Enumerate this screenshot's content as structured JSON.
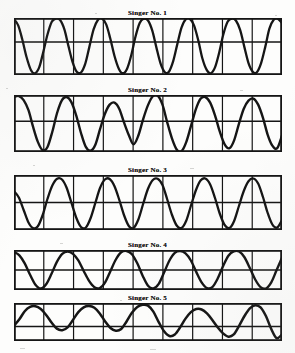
{
  "figure": {
    "kind": "oscillogram-series",
    "panel_count": 5,
    "ink_color": "#151515",
    "paper_color": "#fdfdfc"
  },
  "panels": [
    {
      "title": "Singer No. 1",
      "index": 1,
      "frame": {
        "x": 14,
        "y": 20,
        "width": 268,
        "height": 57
      },
      "v_divisions": 9,
      "axis_fraction": 0.42,
      "trace_width": 2.3
    },
    {
      "title": "Singer No. 2",
      "index": 2,
      "frame": {
        "x": 14,
        "y": 97,
        "width": 268,
        "height": 57
      },
      "v_divisions": 9,
      "axis_fraction": 0.46,
      "trace_width": 2.4
    },
    {
      "title": "Singer No. 3",
      "index": 3,
      "frame": {
        "x": 14,
        "y": 177,
        "width": 268,
        "height": 55
      },
      "v_divisions": 9,
      "axis_fraction": 0.5,
      "trace_width": 2.3
    },
    {
      "title": "Singer No. 4",
      "index": 4,
      "frame": {
        "x": 14,
        "y": 252,
        "width": 268,
        "height": 40
      },
      "v_divisions": 9,
      "axis_fraction": 0.5,
      "trace_width": 2.4
    },
    {
      "title": "Singer No. 5",
      "index": 5,
      "frame": {
        "x": 14,
        "y": 305,
        "width": 268,
        "height": 38
      },
      "v_divisions": 9,
      "axis_fraction": 0.62,
      "trace_width": 2.5
    }
  ],
  "chart_data": [
    {
      "type": "line",
      "title": "Singer No. 1",
      "xlabel": "",
      "ylabel": "",
      "grid": true,
      "legend": "none",
      "xlim": [
        0,
        1
      ],
      "ylim": [
        -1.25,
        1.0
      ],
      "description": "Near-sinusoidal vibrato waveform, about 8 cycles across the record, peaks clipped flat at the top frame line, troughs dipping below the lower frame line.",
      "cycles": 8,
      "series": [
        {
          "name": "trace",
          "x": [
            0.0,
            0.016,
            0.031,
            0.047,
            0.063,
            0.078,
            0.094,
            0.109,
            0.125,
            0.141,
            0.156,
            0.172,
            0.188,
            0.203,
            0.219,
            0.234,
            0.25,
            0.266,
            0.281,
            0.297,
            0.313,
            0.328,
            0.344,
            0.359,
            0.375,
            0.391,
            0.406,
            0.422,
            0.438,
            0.453,
            0.469,
            0.484,
            0.5,
            0.516,
            0.531,
            0.547,
            0.563,
            0.578,
            0.594,
            0.609,
            0.625,
            0.641,
            0.656,
            0.672,
            0.688,
            0.703,
            0.719,
            0.734,
            0.75,
            0.766,
            0.781,
            0.797,
            0.813,
            0.828,
            0.844,
            0.859,
            0.875,
            0.891,
            0.906,
            0.922,
            0.938,
            0.953,
            0.969,
            0.984,
            1.0
          ],
          "y": [
            0.95,
            0.7,
            0.15,
            -0.55,
            -1.05,
            -1.18,
            -0.95,
            -0.35,
            0.35,
            0.85,
            0.98,
            0.92,
            0.55,
            -0.1,
            -0.75,
            -1.12,
            -1.15,
            -0.8,
            -0.15,
            0.55,
            0.92,
            0.98,
            0.75,
            0.2,
            -0.5,
            -1.0,
            -1.18,
            -1.0,
            -0.45,
            0.25,
            0.8,
            0.97,
            0.9,
            0.5,
            -0.15,
            -0.8,
            -1.14,
            -1.12,
            -0.7,
            -0.05,
            0.62,
            0.95,
            0.97,
            0.7,
            0.1,
            -0.6,
            -1.05,
            -1.18,
            -0.95,
            -0.35,
            0.35,
            0.85,
            0.98,
            0.9,
            0.52,
            -0.12,
            -0.78,
            -1.12,
            -1.14,
            -0.78,
            -0.12,
            0.58,
            0.93,
            0.97,
            0.8
          ]
        }
      ]
    },
    {
      "type": "line",
      "title": "Singer No. 2",
      "xlabel": "",
      "ylabel": "",
      "grid": true,
      "legend": "none",
      "xlim": [
        0,
        1
      ],
      "ylim": [
        -1.25,
        1.0
      ],
      "description": "Slower, irregular vibrato with uneven amplitudes; about 6 broad cycles, some peaks reaching the upper frame and deep troughs breaking the lower frame line.",
      "cycles": 6,
      "series": [
        {
          "name": "trace",
          "x": [
            0.0,
            0.018,
            0.036,
            0.054,
            0.071,
            0.089,
            0.107,
            0.125,
            0.143,
            0.161,
            0.179,
            0.196,
            0.214,
            0.232,
            0.25,
            0.268,
            0.286,
            0.304,
            0.321,
            0.339,
            0.357,
            0.375,
            0.393,
            0.411,
            0.429,
            0.446,
            0.464,
            0.482,
            0.5,
            0.518,
            0.536,
            0.554,
            0.571,
            0.589,
            0.607,
            0.625,
            0.643,
            0.661,
            0.679,
            0.696,
            0.714,
            0.732,
            0.75,
            0.768,
            0.786,
            0.804,
            0.821,
            0.839,
            0.857,
            0.875,
            0.893,
            0.911,
            0.929,
            0.946,
            0.964,
            0.982,
            1.0
          ],
          "y": [
            0.92,
            0.96,
            0.8,
            0.4,
            -0.25,
            -0.85,
            -1.18,
            -1.05,
            -0.45,
            0.3,
            0.8,
            0.92,
            0.72,
            0.2,
            -0.5,
            -1.05,
            -1.2,
            -0.95,
            -0.35,
            0.25,
            0.62,
            0.7,
            0.45,
            -0.1,
            -0.6,
            -0.95,
            -0.6,
            0.05,
            0.6,
            0.95,
            0.98,
            0.62,
            -0.05,
            -0.7,
            -1.15,
            -1.22,
            -0.85,
            -0.2,
            0.45,
            0.85,
            0.92,
            0.7,
            0.2,
            -0.45,
            -0.95,
            -1.1,
            -0.8,
            -0.15,
            0.45,
            0.78,
            0.86,
            0.62,
            0.1,
            -0.55,
            -1.0,
            -1.1,
            -0.6
          ]
        }
      ]
    },
    {
      "type": "line",
      "title": "Singer No. 3",
      "xlabel": "",
      "ylabel": "",
      "grid": true,
      "legend": "none",
      "xlim": [
        0,
        1
      ],
      "ylim": [
        -1.2,
        1.0
      ],
      "description": "Regular rounded vibrato of moderate rate, roughly 7 cycles, crests flattened near the top of the frame and troughs touching the baseline frame.",
      "cycles": 7,
      "series": [
        {
          "name": "trace",
          "x": [
            0.0,
            0.018,
            0.036,
            0.054,
            0.071,
            0.089,
            0.107,
            0.125,
            0.143,
            0.161,
            0.179,
            0.196,
            0.214,
            0.232,
            0.25,
            0.268,
            0.286,
            0.304,
            0.321,
            0.339,
            0.357,
            0.375,
            0.393,
            0.411,
            0.429,
            0.446,
            0.464,
            0.482,
            0.5,
            0.518,
            0.536,
            0.554,
            0.571,
            0.589,
            0.607,
            0.625,
            0.643,
            0.661,
            0.679,
            0.696,
            0.714,
            0.732,
            0.75,
            0.768,
            0.786,
            0.804,
            0.821,
            0.839,
            0.857,
            0.875,
            0.893,
            0.911,
            0.929,
            0.946,
            0.964,
            0.982,
            1.0
          ],
          "y": [
            0.35,
            0.1,
            -0.4,
            -0.9,
            -1.12,
            -1.05,
            -0.6,
            0.05,
            0.58,
            0.85,
            0.82,
            0.5,
            -0.1,
            -0.7,
            -1.08,
            -1.1,
            -0.72,
            -0.1,
            0.48,
            0.82,
            0.84,
            0.55,
            0.0,
            -0.62,
            -1.05,
            -1.12,
            -0.78,
            -0.15,
            0.45,
            0.8,
            0.85,
            0.6,
            0.05,
            -0.58,
            -1.02,
            -1.12,
            -0.82,
            -0.2,
            0.4,
            0.78,
            0.86,
            0.62,
            0.08,
            -0.55,
            -1.0,
            -1.12,
            -0.85,
            -0.25,
            0.35,
            0.75,
            0.86,
            0.66,
            0.12,
            -0.5,
            -0.98,
            -1.1,
            -0.8
          ]
        }
      ]
    },
    {
      "type": "line",
      "title": "Singer No. 4",
      "xlabel": "",
      "ylabel": "",
      "grid": true,
      "legend": "none",
      "xlim": [
        0,
        1
      ],
      "ylim": [
        -1.1,
        1.0
      ],
      "description": "Slow, large-amplitude wave of about 5 cycles filling the full height of the shallow frame; broad rounded crests and sharp narrow troughs.",
      "cycles": 5,
      "series": [
        {
          "name": "trace",
          "x": [
            0.0,
            0.02,
            0.04,
            0.06,
            0.08,
            0.1,
            0.12,
            0.14,
            0.16,
            0.18,
            0.2,
            0.22,
            0.24,
            0.26,
            0.28,
            0.3,
            0.32,
            0.34,
            0.36,
            0.38,
            0.4,
            0.42,
            0.44,
            0.46,
            0.48,
            0.5,
            0.52,
            0.54,
            0.56,
            0.58,
            0.6,
            0.62,
            0.64,
            0.66,
            0.68,
            0.7,
            0.72,
            0.74,
            0.76,
            0.78,
            0.8,
            0.82,
            0.84,
            0.86,
            0.88,
            0.9,
            0.92,
            0.94,
            0.96,
            0.98,
            1.0
          ],
          "y": [
            0.9,
            0.72,
            0.3,
            -0.3,
            -0.82,
            -1.02,
            -0.8,
            -0.25,
            0.38,
            0.8,
            0.92,
            0.8,
            0.45,
            -0.1,
            -0.62,
            -0.95,
            -1.0,
            -0.7,
            -0.1,
            0.5,
            0.88,
            0.95,
            0.78,
            0.3,
            -0.35,
            -0.88,
            -1.02,
            -0.78,
            -0.18,
            0.45,
            0.85,
            0.94,
            0.82,
            0.45,
            -0.15,
            -0.7,
            -1.0,
            -0.95,
            -0.5,
            0.15,
            0.7,
            0.93,
            0.92,
            0.62,
            0.05,
            -0.55,
            -0.95,
            -1.02,
            -0.7,
            -0.05,
            0.6,
            0.92
          ]
        }
      ]
    },
    {
      "type": "line",
      "title": "Singer No. 5",
      "xlabel": "",
      "ylabel": "",
      "grid": true,
      "legend": "none",
      "xlim": [
        0,
        1
      ],
      "ylim": [
        -0.75,
        1.0
      ],
      "description": "Shallow, slow and irregular wave riding mostly above a low baseline; about 5 uneven humps with flattened valleys, the final trough dipping through the frame.",
      "cycles": 5,
      "series": [
        {
          "name": "trace",
          "x": [
            0.0,
            0.02,
            0.04,
            0.06,
            0.08,
            0.1,
            0.12,
            0.14,
            0.16,
            0.18,
            0.2,
            0.22,
            0.24,
            0.26,
            0.28,
            0.3,
            0.32,
            0.34,
            0.36,
            0.38,
            0.4,
            0.42,
            0.44,
            0.46,
            0.48,
            0.5,
            0.52,
            0.54,
            0.56,
            0.58,
            0.6,
            0.62,
            0.64,
            0.66,
            0.68,
            0.7,
            0.72,
            0.74,
            0.76,
            0.78,
            0.8,
            0.82,
            0.84,
            0.86,
            0.88,
            0.9,
            0.92,
            0.94,
            0.96,
            0.98,
            1.0
          ],
          "y": [
            -0.05,
            0.25,
            0.62,
            0.82,
            0.85,
            0.72,
            0.45,
            0.1,
            -0.18,
            -0.25,
            -0.12,
            0.22,
            0.58,
            0.8,
            0.86,
            0.78,
            0.52,
            0.15,
            -0.15,
            -0.28,
            -0.2,
            0.15,
            0.55,
            0.82,
            0.92,
            0.88,
            0.6,
            0.12,
            -0.3,
            -0.52,
            -0.45,
            -0.12,
            0.28,
            0.58,
            0.72,
            0.7,
            0.52,
            0.22,
            -0.12,
            -0.4,
            -0.55,
            -0.45,
            -0.05,
            0.4,
            0.75,
            0.9,
            0.8,
            0.4,
            -0.2,
            -0.62,
            -0.45
          ]
        }
      ]
    }
  ]
}
